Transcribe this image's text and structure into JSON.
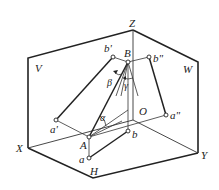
{
  "figure": {
    "type": "three-projection-plane box diagram",
    "planes": {
      "V": "V",
      "W": "W",
      "H": "H"
    },
    "axes": {
      "X": "X",
      "Y": "Y",
      "Z": "Z",
      "O": "O"
    },
    "points": {
      "A": "A",
      "B": "B",
      "a": "a",
      "b": "b",
      "a_prime": "a'",
      "b_prime": "b'",
      "a_double_prime": "a\"",
      "b_double_prime": "b\""
    },
    "angles": {
      "alpha": "α",
      "beta": "β",
      "gamma": "γ"
    }
  }
}
